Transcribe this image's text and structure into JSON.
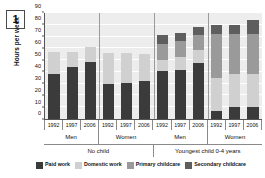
{
  "figure": {
    "number": "1"
  },
  "chart_data": {
    "type": "bar",
    "title": "",
    "subtitle": "",
    "xlabel": "",
    "ylabel": "Hours per week",
    "ylim": [
      0,
      90
    ],
    "yticks": [
      0,
      10,
      20,
      30,
      40,
      50,
      60,
      70,
      80,
      90
    ],
    "ytick_labels": [
      "0",
      "10",
      "20",
      "30",
      "40",
      "50",
      "60",
      "70",
      "80",
      "90"
    ],
    "grid": true,
    "stacked": true,
    "legend_position": "bottom",
    "categories": [
      "1992",
      "1997",
      "2006",
      "1992",
      "1997",
      "2006",
      "1992",
      "1997",
      "2006",
      "1992",
      "1997",
      "2006"
    ],
    "group_labels_sex": [
      "Men",
      "Women",
      "Men",
      "Women"
    ],
    "group_labels_child": [
      "No child",
      "Youngest child 0-4 years"
    ],
    "series": [
      {
        "name": "Paid work",
        "color": "#3b3b3b",
        "values": [
          38,
          44,
          48,
          30,
          31,
          32.5,
          41,
          42,
          47.5,
          7,
          10,
          10.5
        ]
      },
      {
        "name": "Domestic work",
        "color": "#d0d0d0",
        "values": [
          19,
          13,
          13,
          26,
          25,
          22.5,
          9,
          10.5,
          11.5,
          28,
          28,
          27.5
        ]
      },
      {
        "name": "Primary childcare",
        "color": "#9a9a9a",
        "values": [
          0,
          0,
          0,
          0,
          0,
          0,
          14,
          13.5,
          12.5,
          37,
          34,
          34.5
        ]
      },
      {
        "name": "Secondary childcare",
        "color": "#5e5e5e",
        "values": [
          0,
          0,
          0,
          0,
          0,
          0,
          7,
          7,
          7,
          8,
          8,
          11.5
        ]
      }
    ],
    "totals": [
      57,
      57,
      61,
      56,
      56,
      55,
      71,
      73,
      78.5,
      80,
      80,
      84
    ]
  },
  "legend": {
    "items": [
      {
        "label": "Paid work",
        "color": "#3b3b3b"
      },
      {
        "label": "Domestic work",
        "color": "#d0d0d0"
      },
      {
        "label": "Primary childcare",
        "color": "#9a9a9a"
      },
      {
        "label": "Secondary childcare",
        "color": "#5e5e5e"
      }
    ]
  },
  "axis": {
    "plot_bg": "#ededed",
    "gridline_color": "#ffffff",
    "axis_color": "#555555"
  }
}
